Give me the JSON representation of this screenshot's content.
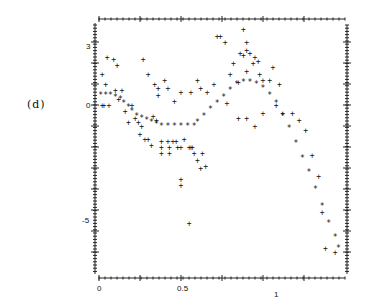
{
  "panel": {
    "label": "(d)"
  },
  "chart_data": {
    "type": "scatter",
    "title": "",
    "xlabel": "",
    "ylabel": "",
    "xlim": [
      0,
      1.5
    ],
    "ylim": [
      -7,
      4
    ],
    "x_ticks": [
      "0",
      "0.5",
      "1"
    ],
    "y_ticks": [
      "3",
      "0",
      "-5"
    ],
    "grid": false,
    "legend": "none",
    "series": [
      {
        "name": "observations",
        "marker": "+",
        "points": [
          [
            0.02,
            1.5
          ],
          [
            0.02,
            0.0
          ],
          [
            0.05,
            2.3
          ],
          [
            0.04,
            1.0
          ],
          [
            0.09,
            2.2
          ],
          [
            0.11,
            1.9
          ],
          [
            0.1,
            0.7
          ],
          [
            0.12,
            0.3
          ],
          [
            0.14,
            0.7
          ],
          [
            0.03,
            0.0
          ],
          [
            0.06,
            0.0
          ],
          [
            0.16,
            -0.3
          ],
          [
            0.2,
            0.0
          ],
          [
            0.22,
            -0.6
          ],
          [
            0.24,
            -0.8
          ],
          [
            0.26,
            -1.0
          ],
          [
            0.27,
            2.2
          ],
          [
            0.3,
            1.5
          ],
          [
            0.34,
            1.0
          ],
          [
            0.36,
            0.8
          ],
          [
            0.33,
            -0.5
          ],
          [
            0.35,
            -0.7
          ],
          [
            0.36,
            0.5
          ],
          [
            0.18,
            -0.8
          ],
          [
            0.25,
            -1.4
          ],
          [
            0.28,
            -1.6
          ],
          [
            0.3,
            -1.6
          ],
          [
            0.32,
            -1.9
          ],
          [
            0.4,
            1.2
          ],
          [
            0.42,
            0.8
          ],
          [
            0.46,
            0.2
          ],
          [
            0.45,
            -1.7
          ],
          [
            0.5,
            -2.0
          ],
          [
            0.52,
            -1.6
          ],
          [
            0.38,
            -1.7
          ],
          [
            0.38,
            -2.0
          ],
          [
            0.38,
            -2.3
          ],
          [
            0.42,
            -1.7
          ],
          [
            0.43,
            -2.0
          ],
          [
            0.43,
            -2.3
          ],
          [
            0.47,
            -1.7
          ],
          [
            0.48,
            -2.0
          ],
          [
            0.55,
            -2.0
          ],
          [
            0.56,
            -2.0
          ],
          [
            0.57,
            -2.0
          ],
          [
            0.58,
            -2.3
          ],
          [
            0.6,
            -2.6
          ],
          [
            0.62,
            -3.0
          ],
          [
            0.63,
            -2.3
          ],
          [
            0.65,
            -2.9
          ],
          [
            0.5,
            -3.5
          ],
          [
            0.5,
            -3.8
          ],
          [
            0.55,
            -5.6
          ],
          [
            0.5,
            0.6
          ],
          [
            0.56,
            0.6
          ],
          [
            0.6,
            1.2
          ],
          [
            0.62,
            0.8
          ],
          [
            0.66,
            0.6
          ],
          [
            0.7,
            1.0
          ],
          [
            0.72,
            3.3
          ],
          [
            0.74,
            3.3
          ],
          [
            0.77,
            3.0
          ],
          [
            0.8,
            1.5
          ],
          [
            0.82,
            2.0
          ],
          [
            0.88,
            3.6
          ],
          [
            0.9,
            3.0
          ],
          [
            0.86,
            2.5
          ],
          [
            0.88,
            2.4
          ],
          [
            0.9,
            2.6
          ],
          [
            0.92,
            2.5
          ],
          [
            0.94,
            2.0
          ],
          [
            0.98,
            1.5
          ],
          [
            1.06,
            1.8
          ],
          [
            0.85,
            1.1
          ],
          [
            0.9,
            1.6
          ],
          [
            0.95,
            2.3
          ],
          [
            0.97,
            2.1
          ],
          [
            1.0,
            1.2
          ],
          [
            1.04,
            1.2
          ],
          [
            1.1,
            1.0
          ],
          [
            0.78,
            0.1
          ],
          [
            0.85,
            -0.6
          ],
          [
            0.9,
            -0.6
          ],
          [
            0.95,
            -1.0
          ],
          [
            1.0,
            -0.4
          ],
          [
            1.08,
            0.0
          ],
          [
            1.12,
            -0.4
          ],
          [
            1.18,
            -0.4
          ],
          [
            1.22,
            -0.7
          ],
          [
            1.26,
            -1.2
          ],
          [
            1.3,
            -2.4
          ],
          [
            1.34,
            -3.4
          ],
          [
            1.36,
            -5.1
          ],
          [
            1.38,
            -6.8
          ],
          [
            1.44,
            -7.0
          ]
        ]
      },
      {
        "name": "fitted_curve",
        "marker": "*",
        "points": [
          [
            0.01,
            0.5
          ],
          [
            0.04,
            0.5
          ],
          [
            0.07,
            0.5
          ],
          [
            0.1,
            0.4
          ],
          [
            0.13,
            0.3
          ],
          [
            0.15,
            0.1
          ],
          [
            0.18,
            -0.1
          ],
          [
            0.2,
            -0.3
          ],
          [
            0.23,
            -0.5
          ],
          [
            0.26,
            -0.6
          ],
          [
            0.29,
            -0.7
          ],
          [
            0.32,
            -0.8
          ],
          [
            0.35,
            -0.9
          ],
          [
            0.38,
            -1.0
          ],
          [
            0.42,
            -1.0
          ],
          [
            0.46,
            -1.0
          ],
          [
            0.5,
            -1.0
          ],
          [
            0.54,
            -1.0
          ],
          [
            0.58,
            -1.0
          ],
          [
            0.6,
            -0.8
          ],
          [
            0.64,
            -0.5
          ],
          [
            0.68,
            -0.2
          ],
          [
            0.72,
            0.1
          ],
          [
            0.76,
            0.4
          ],
          [
            0.8,
            0.7
          ],
          [
            0.84,
            1.0
          ],
          [
            0.88,
            1.1
          ],
          [
            0.92,
            1.1
          ],
          [
            0.96,
            1.0
          ],
          [
            1.0,
            0.8
          ],
          [
            1.04,
            0.5
          ],
          [
            1.08,
            0.1
          ],
          [
            1.12,
            -0.5
          ],
          [
            1.16,
            -1.1
          ],
          [
            1.2,
            -1.8
          ],
          [
            1.24,
            -2.5
          ],
          [
            1.28,
            -3.2
          ],
          [
            1.32,
            -4.0
          ],
          [
            1.36,
            -4.8
          ],
          [
            1.4,
            -5.6
          ],
          [
            1.44,
            -6.3
          ],
          [
            1.46,
            -6.8
          ]
        ]
      }
    ]
  }
}
